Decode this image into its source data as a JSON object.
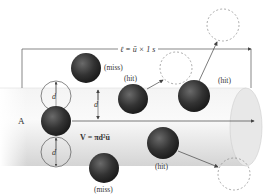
{
  "diagram": {
    "title_formula": "ℓ = ū × 1 s",
    "cylinder_label": "A",
    "volume_formula": "V = πd²ū",
    "diameter_label": "d",
    "labels": {
      "miss_top": "(miss)",
      "miss_bottom": "(miss)",
      "hit_left": "(hit)",
      "hit_right": "(hit)",
      "hit_bottom": "(hit)"
    },
    "colors": {
      "molecule": "#2e2e2e",
      "cylinder": "#e6e6e6",
      "dashed": "#888888",
      "line": "#444444"
    }
  }
}
